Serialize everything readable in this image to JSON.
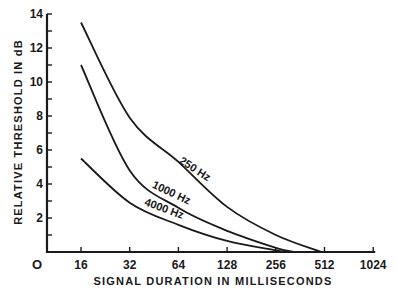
{
  "chart_data": {
    "type": "line",
    "title": "",
    "xlabel": "SIGNAL DURATION IN MILLISECONDS",
    "ylabel": "RELATIVE THRESHOLD IN dB",
    "xscale": "log2",
    "x_ticks": [
      16,
      32,
      64,
      128,
      256,
      512,
      1024
    ],
    "x_tick_labels": [
      "16",
      "32",
      "64",
      "128",
      "256",
      "512",
      "1024"
    ],
    "origin_label": "O",
    "xlim": [
      11,
      1024
    ],
    "y_ticks_labeled": [
      2,
      4,
      6,
      8,
      10,
      12,
      14
    ],
    "y_tick_labels": [
      "2",
      "4",
      "6",
      "8",
      "10",
      "12",
      "14"
    ],
    "y_minor_ticks": [
      1,
      3,
      5,
      7,
      9,
      11,
      13
    ],
    "ylim": [
      0,
      14
    ],
    "grid": false,
    "legend": "inline-labels",
    "series": [
      {
        "name": "250 Hz",
        "label": "250 Hz",
        "x": [
          16,
          32,
          64,
          128,
          256,
          490
        ],
        "values": [
          13.5,
          7.9,
          5.3,
          2.65,
          1.0,
          0.0
        ]
      },
      {
        "name": "1000 Hz",
        "label": "1000 Hz",
        "x": [
          16,
          32,
          64,
          128,
          256,
          330
        ],
        "values": [
          11.0,
          4.8,
          2.6,
          1.25,
          0.25,
          0.0
        ]
      },
      {
        "name": "4000 Hz",
        "label": "4000 Hz",
        "x": [
          16,
          32,
          64,
          128,
          256,
          290
        ],
        "values": [
          5.5,
          2.9,
          1.6,
          0.65,
          0.1,
          0.0
        ]
      }
    ]
  }
}
